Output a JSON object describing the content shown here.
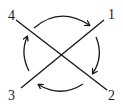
{
  "diagram": {
    "type": "crossed-lines-with-circular-arrows",
    "labels": [
      {
        "id": "1",
        "text": "1",
        "x": 108,
        "y": 8
      },
      {
        "id": "2",
        "text": "2",
        "x": 108,
        "y": 89
      },
      {
        "id": "3",
        "text": "3",
        "x": 8,
        "y": 89
      },
      {
        "id": "4",
        "text": "4",
        "x": 8,
        "y": 9
      }
    ],
    "lines": [
      {
        "from": "4",
        "to": "2"
      },
      {
        "from": "3",
        "to": "1"
      }
    ],
    "arrows": [
      {
        "from": "4-side",
        "to": "1-side",
        "direction": "clockwise"
      },
      {
        "from": "1-side",
        "to": "2-side",
        "direction": "clockwise"
      },
      {
        "from": "2-side",
        "to": "3-side",
        "direction": "clockwise"
      },
      {
        "from": "3-side",
        "to": "4-side",
        "direction": "clockwise"
      }
    ],
    "stroke_color": "#1a1a1a"
  }
}
